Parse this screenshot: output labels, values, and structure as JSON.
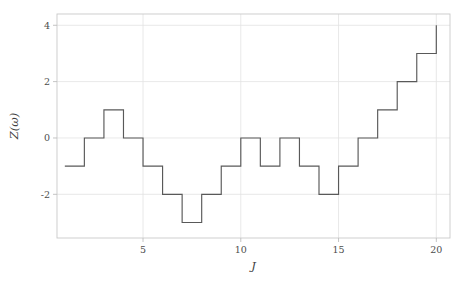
{
  "chart_data": {
    "type": "line",
    "line_style": "step-post",
    "title": "",
    "xlabel": "J",
    "ylabel": "Z(ω)",
    "x": [
      1,
      2,
      3,
      4,
      5,
      6,
      7,
      8,
      9,
      10,
      11,
      12,
      13,
      14,
      15,
      16,
      17,
      18,
      19,
      20
    ],
    "values": [
      -1,
      0,
      1,
      0,
      -1,
      -2,
      -3,
      -2,
      -1,
      0,
      -1,
      0,
      -1,
      -2,
      -1,
      0,
      1,
      2,
      3,
      4
    ],
    "series": [
      {
        "name": "Z(ω)",
        "values": [
          -1,
          0,
          1,
          0,
          -1,
          -2,
          -3,
          -2,
          -1,
          0,
          -1,
          0,
          -1,
          -2,
          -1,
          0,
          1,
          2,
          3,
          4
        ]
      }
    ],
    "xlim": [
      0.6,
      20.7
    ],
    "ylim": [
      -3.55,
      4.4
    ],
    "xticks": [
      5,
      10,
      15,
      20
    ],
    "xticklabels": [
      "5",
      "10",
      "15",
      "20"
    ],
    "yticks": [
      4,
      2,
      0,
      -2
    ],
    "yticklabels": [
      "4",
      "2",
      "0",
      "-2"
    ],
    "grid": true,
    "grid_axis": "both",
    "legend": null,
    "legend_position": "none",
    "colors": {
      "line": "#595959",
      "grid": "#e2e2e2",
      "axis": "#bdbdbd",
      "text": "#4d4d4d",
      "background": "#ffffff"
    }
  }
}
